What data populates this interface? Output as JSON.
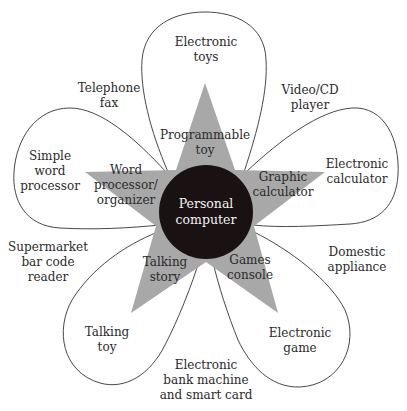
{
  "center": {
    "label": "Personal\ncomputer",
    "fill": "#1a1212",
    "text_color": "#f2f2f2"
  },
  "star": {
    "fill": "#a8a8a8"
  },
  "petal_stroke": "#333333",
  "star_labels": [
    {
      "id": "programmable-toy",
      "label": "Programmable\ntoy"
    },
    {
      "id": "graphic-calculator",
      "label": "Graphic\ncalculator"
    },
    {
      "id": "games-console",
      "label": "Games\nconsole"
    },
    {
      "id": "talking-story",
      "label": "Talking\nstory"
    },
    {
      "id": "word-processor-organizer",
      "label": "Word\nprocessor/\norganizer"
    }
  ],
  "petal_labels": [
    {
      "id": "electronic-toys",
      "label": "Electronic\ntoys"
    },
    {
      "id": "electronic-calculator",
      "label": "Electronic\ncalculator"
    },
    {
      "id": "electronic-game",
      "label": "Electronic\ngame"
    },
    {
      "id": "talking-toy",
      "label": "Talking\ntoy"
    },
    {
      "id": "simple-word-processor",
      "label": "Simple\nword\nprocessor"
    }
  ],
  "outer_labels": [
    {
      "id": "video-cd-player",
      "label": "Video/CD\nplayer"
    },
    {
      "id": "domestic-appliance",
      "label": "Domestic\nappliance"
    },
    {
      "id": "electronic-bank-machine",
      "label": "Electronic\nbank machine\nand smart card"
    },
    {
      "id": "supermarket-bar-code-reader",
      "label": "Supermarket\nbar code\nreader"
    },
    {
      "id": "telephone-fax",
      "label": "Telephone\nfax"
    }
  ]
}
